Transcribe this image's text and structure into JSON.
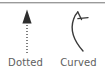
{
  "panel": {
    "background_color": "#ffffff",
    "divider_color": "#9a9a9a",
    "stroke_color": "#3a3a3a",
    "label_color": "#5e5e5e"
  },
  "options": [
    {
      "id": "dotted",
      "label": "Dotted",
      "icon": "dotted-arrow-icon",
      "description": "Straight arrow with dotted shaft and solid arrowhead pointing up"
    },
    {
      "id": "curved",
      "label": "Curved",
      "icon": "curved-arrow-icon",
      "description": "Curved arc with open two-stroke arrowhead at top"
    }
  ]
}
